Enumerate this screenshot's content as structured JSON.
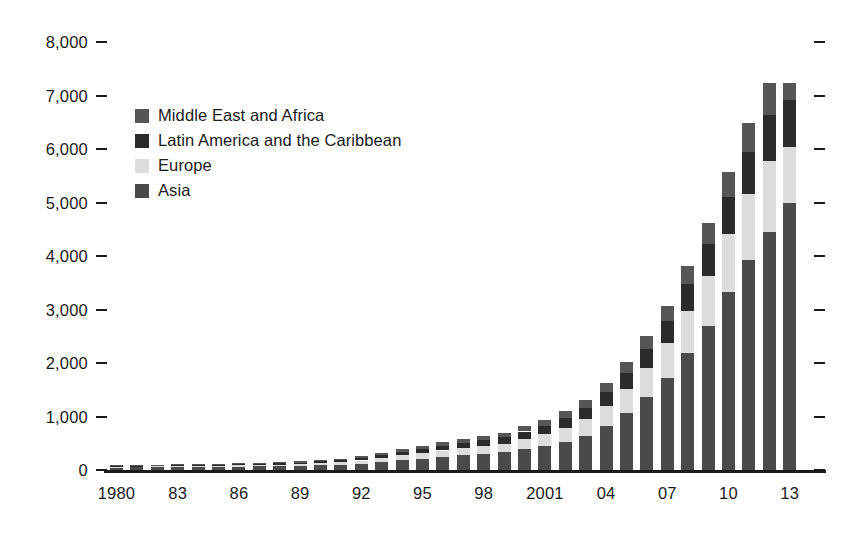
{
  "chart_data": {
    "type": "bar",
    "stacked": true,
    "title": "",
    "subtitle": "",
    "xlabel": "",
    "ylabel": "",
    "ylim": [
      0,
      8000
    ],
    "ytick_values": [
      0,
      1000,
      2000,
      3000,
      4000,
      5000,
      6000,
      7000,
      8000
    ],
    "ytick_labels": [
      "0",
      "1,000",
      "2,000",
      "3,000",
      "4,000",
      "5,000",
      "6,000",
      "7,000",
      "8,000"
    ],
    "grid": false,
    "tick_marks": "dashes on left and right edges",
    "legend_position": "top-left inside plot",
    "categories": [
      "1980",
      "1981",
      "1982",
      "1983",
      "1984",
      "1985",
      "1986",
      "1987",
      "1988",
      "1989",
      "1990",
      "1991",
      "1992",
      "1993",
      "1994",
      "1995",
      "1996",
      "1997",
      "1998",
      "1999",
      "2000",
      "2001",
      "2002",
      "2003",
      "2004",
      "2005",
      "2006",
      "2007",
      "2008",
      "2009",
      "2010",
      "2011",
      "2012",
      "2013"
    ],
    "xtick_labels": [
      "1980",
      "83",
      "86",
      "89",
      "92",
      "95",
      "98",
      "2001",
      "04",
      "07",
      "10",
      "13"
    ],
    "xtick_indices": [
      0,
      3,
      6,
      9,
      12,
      15,
      18,
      21,
      24,
      27,
      30,
      33
    ],
    "series": [
      {
        "name": "Asia",
        "color": "#4a4a4a",
        "values": [
          45,
          48,
          50,
          52,
          55,
          58,
          62,
          66,
          72,
          78,
          88,
          100,
          120,
          150,
          185,
          215,
          245,
          275,
          300,
          330,
          390,
          450,
          530,
          640,
          830,
          1070,
          1370,
          1720,
          2180,
          2700,
          3320,
          3920,
          4450,
          4990
        ]
      },
      {
        "name": "Europe",
        "color": "#dcdcdc",
        "values": [
          18,
          19,
          20,
          21,
          22,
          24,
          26,
          28,
          31,
          34,
          40,
          47,
          58,
          72,
          90,
          105,
          120,
          135,
          148,
          162,
          190,
          220,
          255,
          305,
          370,
          450,
          540,
          650,
          790,
          930,
          1090,
          1230,
          1320,
          1050
        ]
      },
      {
        "name": "Latin America and the Caribbean",
        "color": "#2b2b2b",
        "values": [
          14,
          15,
          16,
          17,
          18,
          19,
          21,
          23,
          25,
          28,
          33,
          38,
          46,
          56,
          68,
          80,
          92,
          103,
          112,
          122,
          140,
          160,
          185,
          215,
          255,
          300,
          355,
          420,
          500,
          590,
          690,
          790,
          870,
          880
        ]
      },
      {
        "name": "Middle East and Africa",
        "color": "#565656",
        "values": [
          10,
          11,
          12,
          13,
          14,
          15,
          16,
          17,
          19,
          21,
          24,
          28,
          33,
          40,
          48,
          56,
          64,
          72,
          79,
          86,
          98,
          112,
          128,
          150,
          175,
          205,
          240,
          285,
          340,
          400,
          470,
          540,
          600,
          320
        ]
      }
    ],
    "totals": [
      87,
      93,
      98,
      103,
      109,
      116,
      125,
      134,
      147,
      161,
      185,
      213,
      257,
      318,
      391,
      456,
      521,
      585,
      639,
      700,
      818,
      942,
      1098,
      1310,
      1630,
      2025,
      2505,
      3075,
      3810,
      4620,
      5570,
      6480,
      7240,
      7240
    ]
  },
  "legend": {
    "items": [
      {
        "label": "Middle East and Africa",
        "color": "#565656"
      },
      {
        "label": "Latin America and the Caribbean",
        "color": "#2b2b2b"
      },
      {
        "label": "Europe",
        "color": "#dcdcdc"
      },
      {
        "label": "Asia",
        "color": "#4a4a4a"
      }
    ]
  },
  "axis_colors": {
    "line": "#1a1a1a",
    "text": "#1a1a1a"
  },
  "background": "#ffffff"
}
